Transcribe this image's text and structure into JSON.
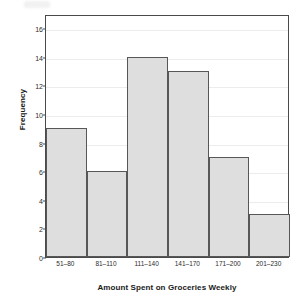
{
  "chart_data": {
    "type": "bar",
    "title": "",
    "subtitle": "",
    "xlabel": "Amount Spent on Groceries Weekly",
    "ylabel": "Frequency",
    "categories": [
      "51–80",
      "81–110",
      "111–140",
      "141–170",
      "171–200",
      "201–230"
    ],
    "values": [
      9,
      6,
      14,
      13,
      7,
      3
    ],
    "ylim": [
      0,
      17
    ],
    "xlim_note": "contiguous histogram bins, no gaps between bars",
    "yticks": [
      0,
      2,
      4,
      6,
      8,
      10,
      12,
      14,
      16
    ],
    "ytick_labels": [
      "0",
      "2",
      "4",
      "6",
      "8",
      "10",
      "12",
      "14",
      "16"
    ],
    "grid": "horizontal gridlines at each y tick, very light gray",
    "legend": "none",
    "legend_position": "none",
    "annotations": [],
    "series": [
      {
        "name": "Frequency",
        "values": [
          9,
          6,
          14,
          13,
          7,
          3
        ]
      }
    ]
  },
  "style": {
    "bar_fill": "#dedede",
    "bar_border": "#575757",
    "frame_color": "#4a4a4a",
    "grid_color": "#ececec",
    "text_color": "#1a1a1a",
    "tick_text_color": "#2b2b2b",
    "background": "#ffffff"
  }
}
